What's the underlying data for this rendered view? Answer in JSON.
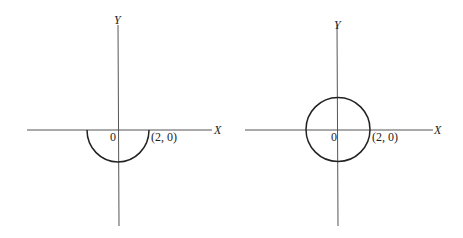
{
  "figures": [
    {
      "id": "left",
      "description": "Lower semicircle of radius 2 centered at origin",
      "x_axis_label": "X",
      "y_axis_label": "Y",
      "origin_label": "0",
      "point_label": "(2, 0)",
      "curve": "lower-semicircle"
    },
    {
      "id": "right",
      "description": "Full circle of radius 2 centered at origin",
      "x_axis_label": "X",
      "y_axis_label": "Y",
      "origin_label": "0",
      "point_label": "(2, 0)",
      "curve": "circle"
    }
  ],
  "colors": {
    "axis": "#555555",
    "curve": "#222222",
    "background": "#ffffff"
  }
}
